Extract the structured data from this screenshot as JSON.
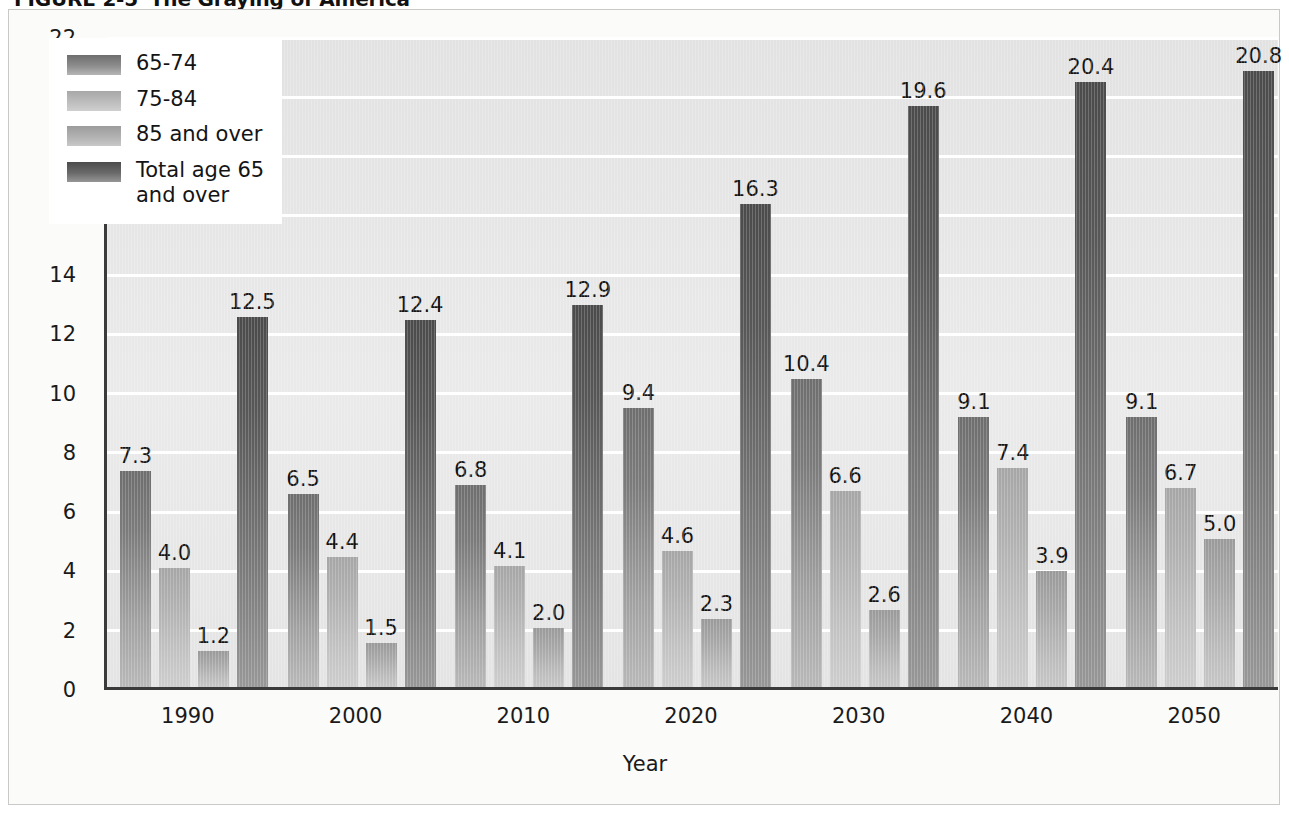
{
  "figure": {
    "number_label": "FIGURE 2-5",
    "caption": "The Graying of America"
  },
  "chart_data": {
    "type": "bar",
    "title": "The Graying of America",
    "xlabel": "Year",
    "ylabel": "Percentage of population",
    "ylim": [
      0,
      22
    ],
    "ytick_step": 2,
    "ytick_labels": [
      "22",
      "20",
      "18",
      "16",
      "14",
      "12",
      "10",
      "8",
      "6",
      "4",
      "2",
      "0"
    ],
    "grid": true,
    "grid_color": "#ffffff",
    "legend_position": "top-left-inside",
    "categories": [
      "1990",
      "2000",
      "2010",
      "2020",
      "2030",
      "2040",
      "2050"
    ],
    "series": [
      {
        "name": "65-74",
        "color": "#7b7b7b",
        "values": [
          7.3,
          6.5,
          6.8,
          9.4,
          10.4,
          9.1,
          9.1
        ],
        "labels": [
          "7.3",
          "6.5",
          "6.8",
          "9.4",
          "10.4",
          "9.1",
          "9.1"
        ]
      },
      {
        "name": "75-84",
        "color": "#b0b0b0",
        "values": [
          4.0,
          4.4,
          4.1,
          4.6,
          6.6,
          7.4,
          6.7
        ],
        "labels": [
          "4.0",
          "4.4",
          "4.1",
          "4.6",
          "6.6",
          "7.4",
          "6.7"
        ]
      },
      {
        "name": "85 and over",
        "color": "#a8a8a8",
        "values": [
          1.2,
          1.5,
          2.0,
          2.3,
          2.6,
          3.9,
          5.0
        ],
        "labels": [
          "1.2",
          "1.5",
          "2.0",
          "2.3",
          "2.6",
          "3.9",
          "5.0"
        ]
      },
      {
        "name": "Total age 65 and over",
        "color": "#575757",
        "values": [
          12.5,
          12.4,
          12.9,
          16.3,
          19.6,
          20.4,
          20.8
        ],
        "labels": [
          "12.5",
          "12.4",
          "12.9",
          "16.3",
          "19.6",
          "20.4",
          "20.8"
        ]
      }
    ],
    "legend_entries": [
      "65-74",
      "75-84",
      "85 and over",
      "Total age 65 and over"
    ]
  }
}
